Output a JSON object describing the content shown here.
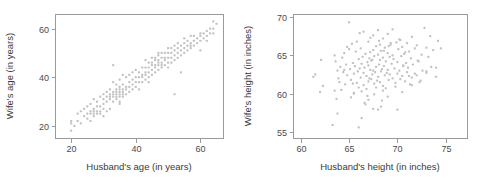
{
  "figure": {
    "background_color": "#ffffff",
    "point_color": "#c2c2c2",
    "axis_color": "#9a9a9a",
    "text_color": "#3a3a3a"
  },
  "chart_data": [
    {
      "type": "scatter",
      "title": "",
      "xlabel": "Husband's age (in years)",
      "ylabel": "Wife's age (in years)",
      "xlim": [
        15,
        67
      ],
      "ylim": [
        15,
        66
      ],
      "xticks": [
        20,
        40,
        60
      ],
      "yticks": [
        20,
        40,
        60
      ],
      "xtick_labels": [
        "20",
        "40",
        "60"
      ],
      "ytick_labels": [
        "20",
        "40",
        "60"
      ],
      "grid": false,
      "legend": null,
      "series": [
        {
          "name": "couples",
          "x": [
            20,
            20,
            20,
            21,
            22,
            22,
            23,
            23,
            24,
            24,
            25,
            25,
            25,
            26,
            26,
            26,
            26,
            27,
            27,
            27,
            27,
            27,
            28,
            28,
            28,
            28,
            29,
            29,
            29,
            29,
            30,
            30,
            30,
            30,
            30,
            31,
            31,
            31,
            31,
            32,
            32,
            32,
            32,
            32,
            33,
            33,
            33,
            33,
            33,
            34,
            34,
            34,
            34,
            34,
            34,
            35,
            35,
            35,
            35,
            35,
            35,
            35,
            36,
            36,
            36,
            36,
            36,
            37,
            37,
            37,
            37,
            38,
            38,
            38,
            38,
            39,
            39,
            39,
            39,
            40,
            40,
            40,
            40,
            41,
            41,
            41,
            42,
            42,
            42,
            42,
            43,
            43,
            43,
            43,
            43,
            44,
            44,
            44,
            44,
            45,
            45,
            45,
            45,
            45,
            46,
            46,
            46,
            46,
            46,
            47,
            47,
            47,
            47,
            47,
            48,
            48,
            48,
            48,
            48,
            49,
            49,
            49,
            49,
            50,
            50,
            50,
            50,
            50,
            51,
            51,
            51,
            51,
            52,
            52,
            52,
            52,
            53,
            53,
            53,
            53,
            54,
            54,
            54,
            55,
            55,
            55,
            55,
            56,
            56,
            56,
            57,
            57,
            57,
            58,
            58,
            58,
            59,
            59,
            60,
            60,
            60,
            61,
            61,
            62,
            62,
            62,
            63,
            63,
            64,
            64,
            64,
            65,
            33,
            35,
            36,
            41,
            44,
            47,
            52,
            54,
            57,
            60
          ],
          "y": [
            18,
            21,
            22,
            20,
            22,
            25,
            21,
            26,
            24,
            27,
            23,
            25,
            28,
            22,
            25,
            26,
            29,
            24,
            25,
            26,
            27,
            31,
            25,
            26,
            28,
            30,
            25,
            26,
            28,
            32,
            24,
            27,
            29,
            31,
            33,
            26,
            30,
            32,
            34,
            27,
            31,
            32,
            33,
            35,
            30,
            32,
            33,
            34,
            38,
            31,
            32,
            33,
            34,
            35,
            37,
            30,
            32,
            33,
            34,
            35,
            36,
            39,
            32,
            33,
            34,
            35,
            41,
            33,
            35,
            36,
            40,
            34,
            36,
            38,
            41,
            35,
            37,
            39,
            42,
            36,
            38,
            40,
            43,
            38,
            40,
            42,
            38,
            40,
            41,
            44,
            39,
            41,
            42,
            44,
            47,
            40,
            42,
            44,
            46,
            41,
            43,
            45,
            46,
            48,
            42,
            44,
            45,
            47,
            48,
            43,
            45,
            46,
            47,
            49,
            44,
            45,
            46,
            48,
            50,
            45,
            47,
            48,
            50,
            44,
            46,
            48,
            50,
            52,
            46,
            48,
            50,
            52,
            47,
            49,
            51,
            53,
            48,
            50,
            52,
            54,
            49,
            51,
            53,
            50,
            52,
            54,
            56,
            51,
            53,
            55,
            52,
            54,
            57,
            53,
            55,
            57,
            54,
            56,
            55,
            57,
            58,
            56,
            58,
            55,
            57,
            59,
            58,
            60,
            58,
            60,
            63,
            62,
            45,
            29,
            37,
            35,
            38,
            50,
            33,
            42,
            53,
            51
          ]
        }
      ]
    },
    {
      "type": "scatter",
      "title": "",
      "xlabel": "Husband's height (in inches)",
      "ylabel": "Wife's height (in inches)",
      "xlim": [
        59.2,
        77.2
      ],
      "ylim": [
        54.2,
        70.4
      ],
      "xticks": [
        60,
        65,
        70,
        75
      ],
      "yticks": [
        55,
        60,
        65,
        70
      ],
      "xtick_labels": [
        "60",
        "65",
        "70",
        "75"
      ],
      "ytick_labels": [
        "55",
        "60",
        "65",
        "70"
      ],
      "grid": false,
      "legend": null,
      "series": [
        {
          "name": "couples",
          "x": [
            61.3,
            61.5,
            62.0,
            62.1,
            62.3,
            63.3,
            63.5,
            63.6,
            63.7,
            63.8,
            63.9,
            64.0,
            64.1,
            64.2,
            64.3,
            64.4,
            64.5,
            64.6,
            64.7,
            64.8,
            65.0,
            65.0,
            65.1,
            65.2,
            65.3,
            65.4,
            65.5,
            65.5,
            65.6,
            65.7,
            65.8,
            65.9,
            66.0,
            66.0,
            66.1,
            66.2,
            66.2,
            66.3,
            66.3,
            66.4,
            66.5,
            66.5,
            66.6,
            66.7,
            66.7,
            66.8,
            66.9,
            67.0,
            67.0,
            67.0,
            67.1,
            67.1,
            67.2,
            67.2,
            67.3,
            67.3,
            67.4,
            67.5,
            67.5,
            67.5,
            67.6,
            67.6,
            67.7,
            67.8,
            67.8,
            67.9,
            68.0,
            68.0,
            68.0,
            68.1,
            68.1,
            68.2,
            68.2,
            68.3,
            68.3,
            68.4,
            68.5,
            68.5,
            68.5,
            68.6,
            68.7,
            68.7,
            68.8,
            68.9,
            69.0,
            69.0,
            69.0,
            69.1,
            69.2,
            69.2,
            69.3,
            69.4,
            69.5,
            69.5,
            69.6,
            69.7,
            69.8,
            69.9,
            70.0,
            70.0,
            70.1,
            70.2,
            70.3,
            70.3,
            70.4,
            70.5,
            70.5,
            70.6,
            70.7,
            70.8,
            70.9,
            71.0,
            71.0,
            71.1,
            71.2,
            71.3,
            71.4,
            71.5,
            71.5,
            71.6,
            71.8,
            72.0,
            72.0,
            72.1,
            72.3,
            72.5,
            72.6,
            72.8,
            73.0,
            73.0,
            73.2,
            73.4,
            73.5,
            73.7,
            74.0,
            74.2,
            74.5,
            63.8,
            65.5,
            66.0,
            66.3,
            67.0,
            67.5,
            68.0,
            68.5,
            69.0,
            70.0,
            65.8,
            66.5,
            67.2,
            68.2,
            69.5,
            64.5,
            66.8,
            67.6,
            68.8,
            70.5,
            71.5,
            73.0,
            74.0,
            63.5,
            65.2,
            66.6,
            68.4,
            69.8,
            71.2,
            72.4,
            64.8,
            67.4,
            69.3,
            70.8,
            72.2,
            66.1,
            68.6,
            70.2,
            71.8,
            67.8,
            69.1,
            70.6,
            65.4,
            66.9,
            68.3
          ],
          "y": [
            62.2,
            62.5,
            60.2,
            64.4,
            61.0,
            55.9,
            65.0,
            64.2,
            59.3,
            63.0,
            62.0,
            61.5,
            63.5,
            60.5,
            64.7,
            62.8,
            65.3,
            61.2,
            63.8,
            62.4,
            69.3,
            65.8,
            63.2,
            61.8,
            66.5,
            64.0,
            62.6,
            60.0,
            63.6,
            65.5,
            61.4,
            62.9,
            64.5,
            60.8,
            63.3,
            65.9,
            62.1,
            63.9,
            60.3,
            64.8,
            62.7,
            61.1,
            63.4,
            65.2,
            58.6,
            62.3,
            64.1,
            66.8,
            63.7,
            61.6,
            64.6,
            62.0,
            65.4,
            63.1,
            61.9,
            64.3,
            62.5,
            67.6,
            65.7,
            63.0,
            61.3,
            64.9,
            62.8,
            66.2,
            63.5,
            61.7,
            68.3,
            65.1,
            62.2,
            66.9,
            63.8,
            61.5,
            64.4,
            62.9,
            65.6,
            63.2,
            67.2,
            64.7,
            61.0,
            63.6,
            62.4,
            66.0,
            64.2,
            62.7,
            67.8,
            65.3,
            63.1,
            61.8,
            64.8,
            62.5,
            66.4,
            63.9,
            65.0,
            62.0,
            64.5,
            63.3,
            61.4,
            66.7,
            64.1,
            62.6,
            65.8,
            63.0,
            67.0,
            61.9,
            64.9,
            62.3,
            66.1,
            63.7,
            65.2,
            61.6,
            64.0,
            62.8,
            66.6,
            63.4,
            65.5,
            61.2,
            64.6,
            62.1,
            67.4,
            63.8,
            65.9,
            62.4,
            66.3,
            64.3,
            61.5,
            65.1,
            63.0,
            68.6,
            66.0,
            62.7,
            64.8,
            67.5,
            63.5,
            65.7,
            62.2,
            66.9,
            65.9,
            57.4,
            60.1,
            55.6,
            56.8,
            59.2,
            58.0,
            57.9,
            60.4,
            59.6,
            57.9,
            66.8,
            68.1,
            67.3,
            66.4,
            68.4,
            63.1,
            60.6,
            59.9,
            60.7,
            60.2,
            61.1,
            62.9,
            63.4,
            60.4,
            59.5,
            58.8,
            59.1,
            60.9,
            62.3,
            61.7,
            66.1,
            64.4,
            66.6,
            65.4,
            64.2,
            67.9,
            65.6,
            67.1,
            62.6,
            60.8,
            66.2,
            63.6,
            61.3,
            59.7,
            58.3
          ]
        }
      ]
    }
  ]
}
